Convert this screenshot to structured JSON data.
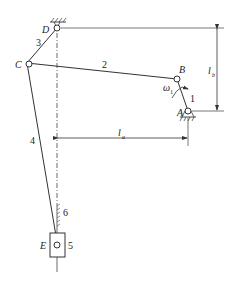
{
  "diagram": {
    "type": "six-bar linkage mechanism",
    "joints": {
      "A": {
        "label": "A",
        "x": 188,
        "y": 111
      },
      "B": {
        "label": "B",
        "x": 177,
        "y": 79
      },
      "C": {
        "label": "C",
        "x": 27,
        "y": 63
      },
      "D": {
        "label": "D",
        "x": 57,
        "y": 28
      },
      "E": {
        "label": "E",
        "x": 57,
        "y": 243
      }
    },
    "links": [
      {
        "id": "1",
        "label": "1"
      },
      {
        "id": "2",
        "label": "2"
      },
      {
        "id": "3",
        "label": "3"
      },
      {
        "id": "4",
        "label": "4"
      },
      {
        "id": "5",
        "label": "5"
      },
      {
        "id": "6",
        "label": "6"
      }
    ],
    "angular_velocity": {
      "symbol": "ω",
      "subscript": "1"
    },
    "dimensions": {
      "la": {
        "symbol": "l",
        "subscript": "a"
      },
      "lb": {
        "symbol": "l",
        "subscript": "b"
      }
    },
    "colors": {
      "line": "#333333",
      "background": "#ffffff"
    }
  }
}
